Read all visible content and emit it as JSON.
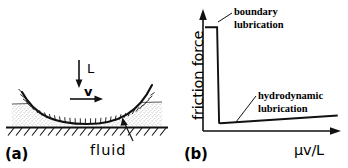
{
  "figure": {
    "ink_color": "#000000",
    "background_color": "#ffffff"
  },
  "panel_a": {
    "tag": "(a)",
    "load_arrow_label": "L",
    "velocity_arrow_label": "v",
    "fluid_label": "fluid",
    "icons": {
      "load_arrow": "arrow-down-icon",
      "velocity_arrow": "arrow-right-icon",
      "fluid_pointer": "arrow-up-icon",
      "slider": "curved-slider-shape",
      "fluid_film": "stippled-fluid-layer",
      "ground": "hatched-ground-line"
    }
  },
  "panel_b": {
    "tag": "(b)",
    "ylabel": "friction force",
    "xlabel": "μv/L",
    "annotations": [
      {
        "line1": "boundary",
        "line2": "lubrication"
      },
      {
        "line1": "hydrodynamic",
        "line2": "lubrication"
      }
    ],
    "icons": {
      "y_axis_arrow": "arrow-up-icon",
      "x_axis_arrow": "arrow-right-icon",
      "leader_boundary": "leader-line",
      "leader_hydrodynamic": "leader-line"
    }
  },
  "chart_data": {
    "type": "line",
    "xlabel": "μv/L",
    "ylabel": "friction force",
    "xlim": [
      0,
      1
    ],
    "ylim": [
      0,
      1
    ],
    "grid": false,
    "legend": "none",
    "axis_ticks": {
      "x": [],
      "y": []
    },
    "series": [
      {
        "name": "friction force",
        "x": [
          0.0,
          0.09,
          0.105,
          0.115,
          0.99
        ],
        "y": [
          0.95,
          0.95,
          0.04,
          0.035,
          0.11
        ],
        "regimes": [
          "boundary",
          "boundary",
          "transition",
          "hydrodynamic",
          "hydrodynamic"
        ]
      }
    ],
    "annotations": [
      {
        "text": "boundary lubrication",
        "x": 0.11,
        "y": 0.96
      },
      {
        "text": "hydrodynamic lubrication",
        "x": 0.4,
        "y": 0.3
      }
    ]
  }
}
